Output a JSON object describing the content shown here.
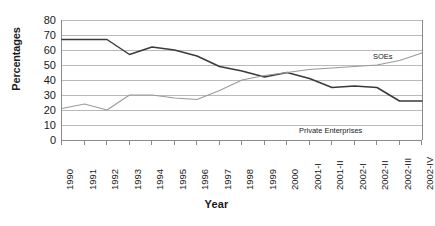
{
  "chart_data": {
    "type": "line",
    "title": "",
    "xlabel": "Year",
    "ylabel": "Percentages",
    "ylim": [
      0,
      80
    ],
    "yticks": [
      0,
      10,
      20,
      30,
      40,
      50,
      60,
      70,
      80
    ],
    "grid": true,
    "legend_position": "in-plot-annotations",
    "categories": [
      "1990",
      "1991",
      "1992",
      "1993",
      "1994",
      "1995",
      "1996",
      "1997",
      "1998",
      "1999",
      "2000",
      "2001-I",
      "2001-II",
      "2002-I",
      "2002-II",
      "2002-III",
      "2002-IV"
    ],
    "series": [
      {
        "name": "SOEs",
        "color": "#3a3a3a",
        "values": [
          67,
          67,
          67,
          57,
          62,
          60,
          56,
          49,
          46,
          42,
          45,
          41,
          35,
          36,
          35,
          26,
          26
        ]
      },
      {
        "name": "Private Enterprises",
        "color": "#9a9a9a",
        "values": [
          21,
          24,
          20,
          30,
          30,
          28,
          27,
          33,
          40,
          43,
          45,
          47,
          48,
          49,
          50,
          53,
          58
        ]
      }
    ],
    "annotations": [
      {
        "text": "SOEs",
        "near": "upper-right"
      },
      {
        "text": "Private Enterprises",
        "near": "lower-right"
      }
    ]
  },
  "axes": {
    "y_title": "Percentages",
    "x_title": "Year"
  }
}
